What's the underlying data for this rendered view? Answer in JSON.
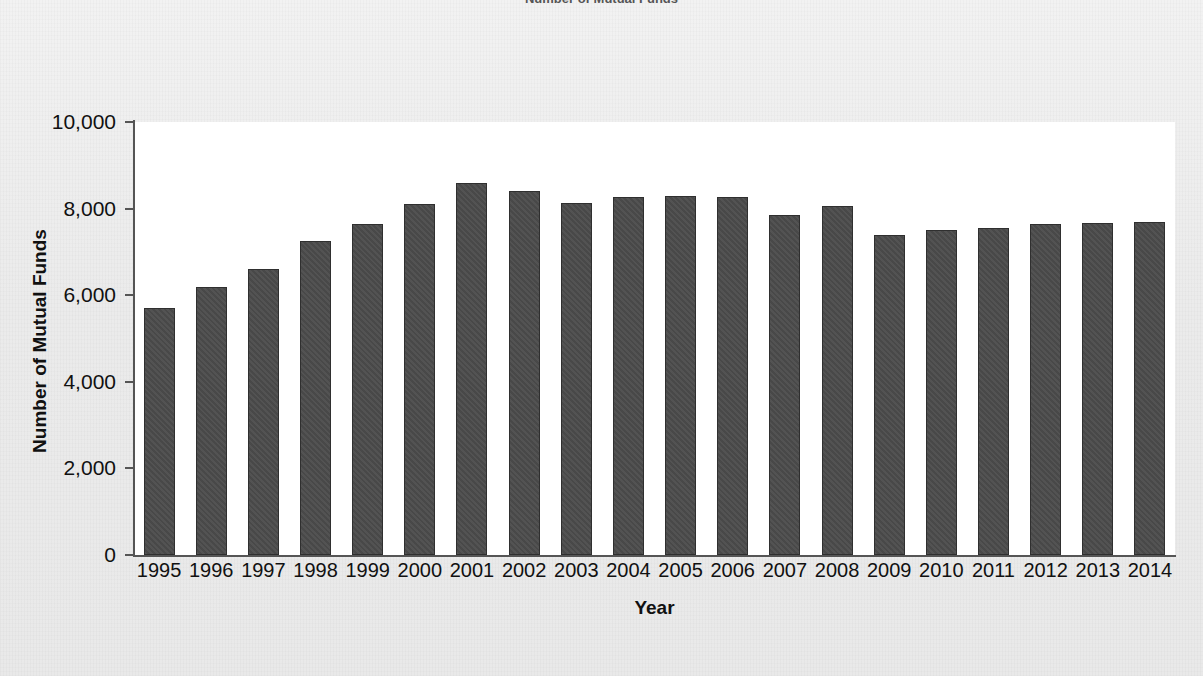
{
  "title_clipped": "Number of Mutual Funds",
  "axes": {
    "y_label": "Number of Mutual Funds",
    "x_label": "Year",
    "y_ticks": [
      "0",
      "2,000",
      "4,000",
      "6,000",
      "8,000",
      "10,000"
    ]
  },
  "colors": {
    "bar_fill": "#4b4b4b",
    "bar_stroke": "#2f2f2f",
    "axis": "#555555",
    "plot_background": "#ffffff",
    "page_background": "#eeeeee",
    "text": "#111111"
  },
  "chart_data": {
    "type": "bar",
    "title": "Number of Mutual Funds",
    "xlabel": "Year",
    "ylabel": "Number of Mutual Funds",
    "ylim": [
      0,
      10000
    ],
    "ytick_values": [
      0,
      2000,
      4000,
      6000,
      8000,
      10000
    ],
    "grid": false,
    "legend": null,
    "categories": [
      "1995",
      "1996",
      "1997",
      "1998",
      "1999",
      "2000",
      "2001",
      "2002",
      "2003",
      "2004",
      "2005",
      "2006",
      "2007",
      "2008",
      "2009",
      "2010",
      "2011",
      "2012",
      "2013",
      "2014"
    ],
    "values": [
      5700,
      6200,
      6600,
      7250,
      7650,
      8100,
      8600,
      8400,
      8125,
      8275,
      8300,
      8275,
      7850,
      8050,
      7400,
      7500,
      7550,
      7650,
      7675,
      7700
    ]
  }
}
